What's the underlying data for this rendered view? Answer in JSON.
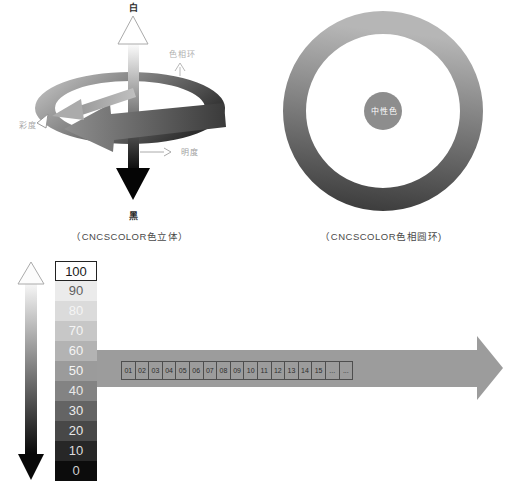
{
  "color_solid": {
    "top_label": "白",
    "bottom_label": "黑",
    "hue_ring_label": "色相环",
    "chroma_label": "彩度",
    "lightness_label": "明度",
    "caption": "（CNCSCOLOR色立体）"
  },
  "hue_circle": {
    "center_label": "中性色",
    "caption": "（CNCSCOLOR色相圆环)"
  },
  "lightness_scale": {
    "rows": [
      {
        "label": "100",
        "bg": "#ffffff",
        "fg": "#1a1a1a"
      },
      {
        "label": "90",
        "bg": "#ebebeb",
        "fg": "#5f5f5f"
      },
      {
        "label": "80",
        "bg": "#dbdbdb",
        "fg": "#f5f5f5"
      },
      {
        "label": "70",
        "bg": "#c7c7c7",
        "fg": "#f5f5f5"
      },
      {
        "label": "60",
        "bg": "#b3b3b3",
        "fg": "#f5f5f5"
      },
      {
        "label": "50",
        "bg": "#9b9b9b",
        "fg": "#f5f5f5"
      },
      {
        "label": "40",
        "bg": "#838383",
        "fg": "#e9e9e9"
      },
      {
        "label": "30",
        "bg": "#646464",
        "fg": "#ececec"
      },
      {
        "label": "20",
        "bg": "#484848",
        "fg": "#e9e9e9"
      },
      {
        "label": "10",
        "bg": "#272727",
        "fg": "#dddddd"
      },
      {
        "label": "0",
        "bg": "#0c0c0c",
        "fg": "#cfcfcf"
      }
    ]
  },
  "hue_axis": {
    "cells": [
      "01",
      "02",
      "03",
      "04",
      "05",
      "06",
      "07",
      "08",
      "09",
      "10",
      "11",
      "12",
      "13",
      "14",
      "15",
      "...",
      "..."
    ],
    "arrow_color": "#9c9c9c"
  },
  "bottom_caption": "（CNCSCOLOR明度）",
  "colors": {
    "ring_light": "#b6b6b6",
    "ring_dark": "#3e3e3e",
    "neutral_circle": "#8d8d8d",
    "axis_arrow_gray": "#9c9c9c"
  }
}
